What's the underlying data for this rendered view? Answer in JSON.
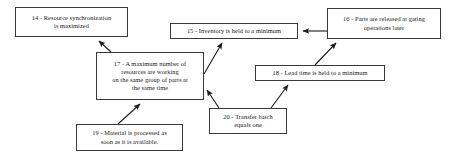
{
  "diagram": {
    "background_color": "#ffffff",
    "node_border_color": "#3a3a3a",
    "edge_color": "#1a1a1a",
    "nodes": [
      {
        "id": "14",
        "label": "14 - Resource synchronization\nis maximized"
      },
      {
        "id": "15",
        "label": "15 - Inventory is held to a minimum"
      },
      {
        "id": "16",
        "label": "16 - Parts are released at gating\noperations later"
      },
      {
        "id": "17",
        "label": "17 - A maximum number of\nresources are working\non the same group of parts at\nthe same time"
      },
      {
        "id": "18",
        "label": "18 - Lead time is held to a minimum"
      },
      {
        "id": "19",
        "label": "19 - Material is processed as\nsoon as it is available."
      },
      {
        "id": "20",
        "label": "20 - Transfer batch\nequals one"
      }
    ],
    "edges": [
      {
        "from": "17",
        "to": "14",
        "kind": "arrow"
      },
      {
        "from": "17",
        "to": "15",
        "kind": "arrow"
      },
      {
        "from": "16",
        "to": "15",
        "kind": "arrow"
      },
      {
        "from": "18",
        "to": "16",
        "kind": "arrow"
      },
      {
        "from": "19",
        "to": "17",
        "kind": "arrow"
      },
      {
        "from": "20",
        "to": "17",
        "kind": "arrow"
      },
      {
        "from": "20",
        "to": "18",
        "kind": "arrow"
      }
    ]
  }
}
